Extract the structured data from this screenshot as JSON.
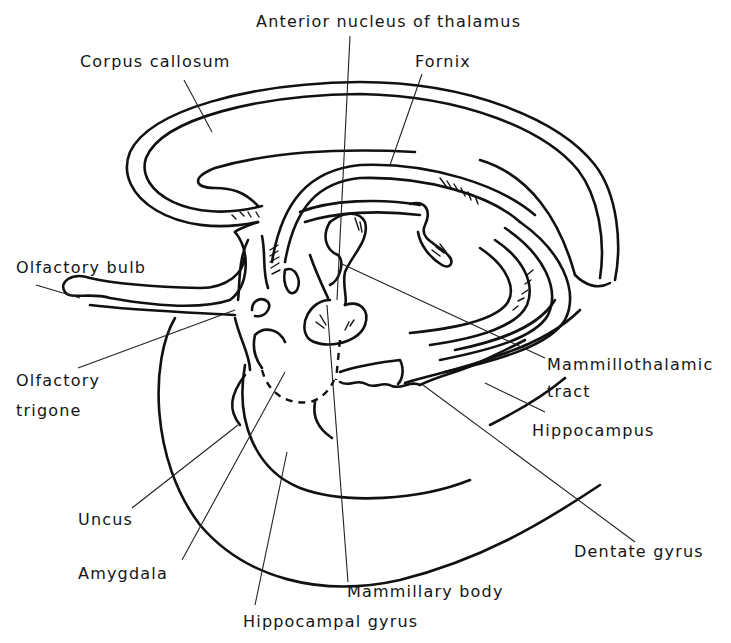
{
  "diagram": {
    "labels": [
      {
        "id": "anterior-nucleus",
        "text": "Anterior nucleus of thalamus",
        "x": 256,
        "y": 12
      },
      {
        "id": "corpus-callosum",
        "text": "Corpus callosum",
        "x": 80,
        "y": 52
      },
      {
        "id": "fornix",
        "text": "Fornix",
        "x": 415,
        "y": 52
      },
      {
        "id": "olfactory-bulb",
        "text": "Olfactory bulb",
        "x": 16,
        "y": 258
      },
      {
        "id": "olfactory-trigone-1",
        "text": "Olfactory",
        "x": 16,
        "y": 371
      },
      {
        "id": "olfactory-trigone-2",
        "text": "trigone",
        "x": 16,
        "y": 401
      },
      {
        "id": "mammillothalamic-1",
        "text": "Mammillothalamic",
        "x": 547,
        "y": 355
      },
      {
        "id": "mammillothalamic-2",
        "text": "tract",
        "x": 547,
        "y": 382
      },
      {
        "id": "hippocampus",
        "text": "Hippocampus",
        "x": 532,
        "y": 421
      },
      {
        "id": "uncus",
        "text": "Uncus",
        "x": 78,
        "y": 510
      },
      {
        "id": "amygdala",
        "text": "Amygdala",
        "x": 78,
        "y": 564
      },
      {
        "id": "dentate-gyrus",
        "text": "Dentate gyrus",
        "x": 574,
        "y": 542
      },
      {
        "id": "mammillary-body",
        "text": "Mammillary body",
        "x": 347,
        "y": 582
      },
      {
        "id": "hippocampal-gyrus",
        "text": "Hippocampal gyrus",
        "x": 243,
        "y": 612
      }
    ]
  }
}
